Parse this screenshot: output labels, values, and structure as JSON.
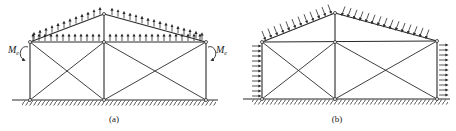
{
  "figures": [
    {
      "id": "a",
      "caption": "(a)",
      "moment_label_left": "M",
      "moment_sub_left": "e",
      "moment_label_right": "M",
      "moment_sub_right": "e",
      "load": "upward uniform suction on roof and top chord"
    },
    {
      "id": "b",
      "caption": "(b)",
      "load": "inclined suction on roof slopes, horizontal loads on both walls"
    }
  ],
  "colors": {
    "line": "#2a2a2a",
    "background": "#ffffff"
  }
}
